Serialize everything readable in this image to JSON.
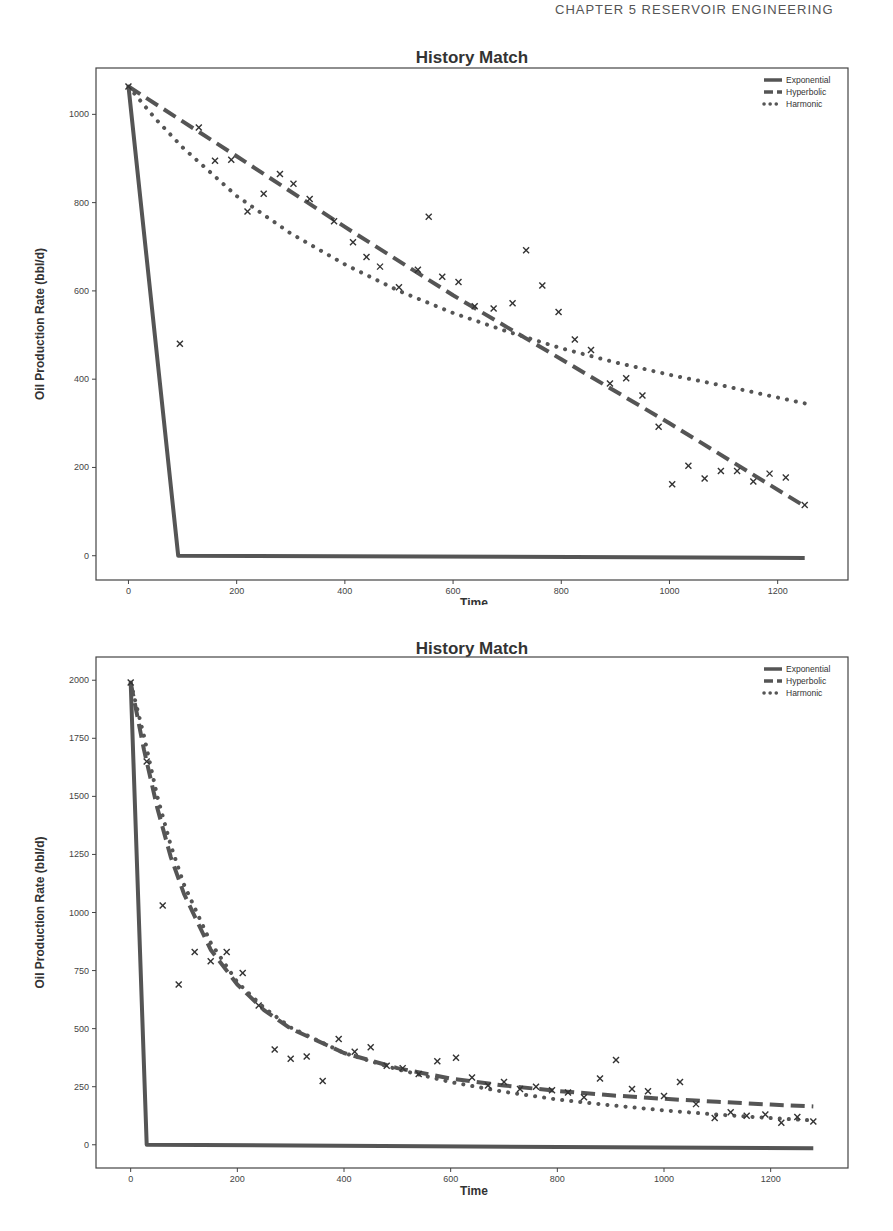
{
  "page": {
    "running_head": "CHAPTER 5    RESERVOIR ENGINEERING"
  },
  "chart_data": [
    {
      "type": "line",
      "title": "History Match",
      "xlabel": "Time",
      "ylabel": "Oil Production Rate (bbl/d)",
      "xlim": [
        -60,
        1330
      ],
      "ylim": [
        -55,
        1105
      ],
      "xticks": [
        0,
        200,
        400,
        600,
        800,
        1000,
        1200
      ],
      "yticks": [
        0,
        200,
        400,
        600,
        800,
        1000
      ],
      "grid": false,
      "legend_position": "upper right",
      "legend": [
        "Exponential",
        "Hyperbolic",
        "Harmonic"
      ],
      "series": [
        {
          "name": "Exponential",
          "style": "solid",
          "x": [
            0,
            92,
            1250
          ],
          "y": [
            1063,
            0,
            -5
          ]
        },
        {
          "name": "Hyperbolic",
          "style": "dashed",
          "x": [
            0,
            200,
            400,
            600,
            800,
            1000,
            1250
          ],
          "y": [
            1063,
            905,
            745,
            590,
            445,
            300,
            112
          ]
        },
        {
          "name": "Harmonic",
          "style": "dotted",
          "x": [
            0,
            50,
            100,
            200,
            300,
            400,
            500,
            600,
            700,
            800,
            900,
            1000,
            1100,
            1250
          ],
          "y": [
            1063,
            990,
            925,
            815,
            730,
            660,
            600,
            550,
            508,
            470,
            438,
            410,
            385,
            345
          ]
        }
      ],
      "scatter": {
        "name": "Observed",
        "marker": "x",
        "x": [
          0,
          95,
          130,
          160,
          190,
          220,
          250,
          280,
          305,
          335,
          380,
          415,
          440,
          465,
          500,
          535,
          555,
          580,
          610,
          640,
          675,
          710,
          735,
          765,
          795,
          825,
          855,
          890,
          920,
          950,
          980,
          1005,
          1035,
          1065,
          1095,
          1125,
          1155,
          1185,
          1215,
          1250
        ],
        "y": [
          1063,
          480,
          970,
          895,
          897,
          780,
          820,
          865,
          843,
          808,
          758,
          710,
          677,
          655,
          608,
          648,
          768,
          632,
          620,
          565,
          560,
          572,
          692,
          612,
          552,
          490,
          466,
          390,
          402,
          363,
          292,
          162,
          204,
          175,
          192,
          192,
          168,
          186,
          177,
          115
        ]
      }
    },
    {
      "type": "line",
      "title": "History Match",
      "xlabel": "Time",
      "ylabel": "Oil Production Rate (bbl/d)",
      "xlim": [
        -65,
        1345
      ],
      "ylim": [
        -100,
        2100
      ],
      "xticks": [
        0,
        200,
        400,
        600,
        800,
        1000,
        1200
      ],
      "yticks": [
        0,
        250,
        500,
        750,
        1000,
        1250,
        1500,
        1750,
        2000
      ],
      "grid": false,
      "legend_position": "upper right",
      "legend": [
        "Exponential",
        "Hyperbolic",
        "Harmonic"
      ],
      "series": [
        {
          "name": "Exponential",
          "style": "solid",
          "x": [
            0,
            30,
            1280
          ],
          "y": [
            1990,
            0,
            -15
          ]
        },
        {
          "name": "Hyperbolic",
          "style": "dashed",
          "x": [
            0,
            25,
            50,
            75,
            100,
            150,
            200,
            250,
            300,
            400,
            500,
            600,
            700,
            800,
            900,
            1000,
            1100,
            1200,
            1280
          ],
          "y": [
            1990,
            1700,
            1450,
            1240,
            1080,
            840,
            690,
            580,
            500,
            395,
            330,
            285,
            255,
            232,
            213,
            198,
            185,
            173,
            165
          ]
        },
        {
          "name": "Harmonic",
          "style": "dotted",
          "x": [
            0,
            25,
            50,
            75,
            100,
            150,
            200,
            250,
            300,
            400,
            500,
            600,
            700,
            800,
            900,
            1000,
            1100,
            1200,
            1280
          ],
          "y": [
            1990,
            1760,
            1500,
            1290,
            1120,
            870,
            700,
            590,
            505,
            395,
            325,
            270,
            228,
            195,
            170,
            148,
            130,
            115,
            105
          ]
        }
      ],
      "scatter": {
        "name": "Observed",
        "marker": "x",
        "x": [
          0,
          30,
          60,
          90,
          120,
          150,
          180,
          210,
          240,
          270,
          300,
          330,
          360,
          390,
          420,
          450,
          480,
          510,
          540,
          575,
          610,
          640,
          670,
          700,
          730,
          760,
          790,
          820,
          850,
          880,
          910,
          940,
          970,
          1000,
          1030,
          1060,
          1095,
          1125,
          1155,
          1190,
          1220,
          1250,
          1280
        ],
        "y": [
          1990,
          1650,
          1030,
          690,
          830,
          790,
          830,
          740,
          600,
          410,
          370,
          380,
          275,
          455,
          400,
          420,
          340,
          330,
          305,
          360,
          375,
          290,
          255,
          270,
          240,
          250,
          235,
          225,
          205,
          285,
          365,
          240,
          230,
          210,
          270,
          175,
          115,
          140,
          125,
          130,
          95,
          120,
          100
        ]
      }
    }
  ]
}
